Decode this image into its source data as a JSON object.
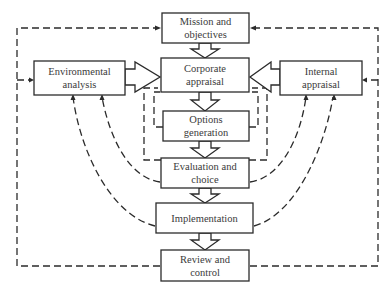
{
  "diagram": {
    "type": "strategic-planning-process-flowchart",
    "nodes": {
      "mission": {
        "line1": "Mission and",
        "line2": "objectives"
      },
      "corporate": {
        "line1": "Corporate",
        "line2": "appraisal"
      },
      "options": {
        "line1": "Options",
        "line2": "generation"
      },
      "evaluation": {
        "line1": "Evaluation and",
        "line2": "choice"
      },
      "implementation": {
        "line1": "Implementation"
      },
      "review": {
        "line1": "Review and",
        "line2": "control"
      },
      "environmental": {
        "line1": "Environmental",
        "line2": "analysis"
      },
      "internal": {
        "line1": "Internal",
        "line2": "appraisal"
      }
    },
    "edges": [
      {
        "from": "Mission and objectives",
        "to": "Corporate appraisal",
        "style": "hollow-arrow"
      },
      {
        "from": "Corporate appraisal",
        "to": "Options generation",
        "style": "hollow-arrow"
      },
      {
        "from": "Options generation",
        "to": "Evaluation and choice",
        "style": "hollow-arrow"
      },
      {
        "from": "Evaluation and choice",
        "to": "Implementation",
        "style": "hollow-arrow"
      },
      {
        "from": "Implementation",
        "to": "Review and control",
        "style": "hollow-arrow"
      },
      {
        "from": "Environmental analysis",
        "to": "Corporate appraisal",
        "style": "hollow-arrow"
      },
      {
        "from": "Internal appraisal",
        "to": "Corporate appraisal",
        "style": "hollow-arrow"
      },
      {
        "from": "Review and control",
        "to": "Mission and objectives",
        "style": "dashed-feedback"
      },
      {
        "from": "Review and control",
        "to": "Environmental analysis",
        "style": "dashed-feedback"
      },
      {
        "from": "Review and control",
        "to": "Internal appraisal",
        "style": "dashed-feedback"
      },
      {
        "from": "Evaluation and choice",
        "to": "Environmental analysis",
        "style": "dashed-feedback"
      },
      {
        "from": "Implementation",
        "to": "Environmental analysis",
        "style": "dashed-feedback"
      },
      {
        "from": "Evaluation and choice",
        "to": "Internal appraisal",
        "style": "dashed-feedback"
      },
      {
        "from": "Implementation",
        "to": "Internal appraisal",
        "style": "dashed-feedback"
      },
      {
        "from": "Options generation",
        "to": "Corporate appraisal",
        "style": "dashed-feedback"
      },
      {
        "from": "Evaluation and choice",
        "to": "Corporate appraisal",
        "style": "dashed-feedback"
      }
    ],
    "colors": {
      "stroke": "#2b2b2b",
      "text": "#3a3a3a",
      "background": "#ffffff"
    }
  }
}
